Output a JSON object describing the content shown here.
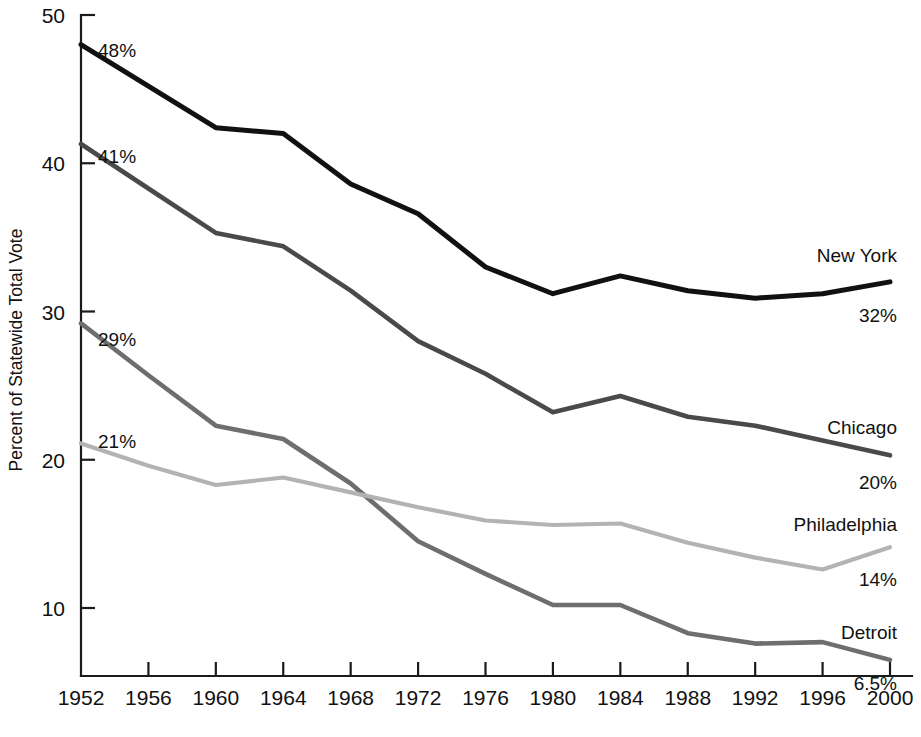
{
  "chart_data": {
    "type": "line",
    "title": "",
    "xlabel": "",
    "ylabel": "Percent of Statewide Total Vote",
    "x": [
      1952,
      1956,
      1960,
      1964,
      1968,
      1972,
      1976,
      1980,
      1984,
      1988,
      1992,
      1996,
      2000
    ],
    "xlim": [
      1952,
      2000
    ],
    "ylim": [
      4,
      50
    ],
    "y_ticks": [
      10,
      20,
      30,
      40,
      50
    ],
    "y_tick_labels": [
      "10",
      "20",
      "30",
      "40",
      "50"
    ],
    "x_tick_labels": [
      "1952",
      "1956",
      "1960",
      "1964",
      "1968",
      "1972",
      "1976",
      "1980",
      "1984",
      "1988",
      "1992",
      "1996",
      "2000"
    ],
    "grid": false,
    "legend_position": "right-inline-labels",
    "series": [
      {
        "name": "New York",
        "color": "#111111",
        "width": 5.0,
        "values": [
          48.0,
          45.2,
          42.4,
          42.0,
          38.6,
          36.6,
          33.0,
          31.2,
          32.4,
          31.4,
          30.9,
          31.2,
          32.0
        ],
        "start_label": "48%",
        "end_label": "32%"
      },
      {
        "name": "Chicago",
        "color": "#4a4a4a",
        "width": 4.6,
        "values": [
          41.3,
          38.3,
          35.3,
          34.4,
          31.4,
          28.0,
          25.8,
          23.2,
          24.3,
          22.9,
          22.3,
          21.3,
          20.3
        ],
        "start_label": "41%",
        "end_label": "20%"
      },
      {
        "name": "Detroit",
        "color": "#6e6e6e",
        "width": 4.6,
        "values": [
          29.2,
          25.7,
          22.3,
          21.4,
          18.4,
          14.5,
          12.3,
          10.2,
          10.2,
          8.3,
          7.6,
          7.7,
          6.5
        ],
        "start_label": "29%",
        "end_label": "6.5%"
      },
      {
        "name": "Philadelphia",
        "color": "#b3b3b3",
        "width": 4.2,
        "values": [
          21.1,
          19.6,
          18.3,
          18.8,
          17.8,
          16.8,
          15.9,
          15.6,
          15.7,
          14.4,
          13.4,
          12.6,
          14.1
        ],
        "start_label": "21%",
        "end_label": "14%"
      }
    ],
    "start_annotations": [
      {
        "text": "48%",
        "series": "New York"
      },
      {
        "text": "41%",
        "series": "Chicago"
      },
      {
        "text": "29%",
        "series": "Detroit"
      },
      {
        "text": "21%",
        "series": "Philadelphia"
      }
    ],
    "end_annotations": [
      {
        "text": "32%",
        "series": "New York"
      },
      {
        "text": "20%",
        "series": "Chicago"
      },
      {
        "text": "14%",
        "series": "Philadelphia"
      },
      {
        "text": "6.5%",
        "series": "Detroit"
      }
    ]
  },
  "axis": {
    "y_label": "Percent of Statewide Total Vote",
    "y_ticks": [
      "50",
      "40",
      "30",
      "20",
      "10"
    ],
    "x_ticks": [
      "1952",
      "1956",
      "1960",
      "1964",
      "1968",
      "1972",
      "1976",
      "1980",
      "1984",
      "1988",
      "1992",
      "1996",
      "2000"
    ]
  },
  "annotations": {
    "ny_start": "48%",
    "chi_start": "41%",
    "det_start": "29%",
    "phi_start": "21%",
    "ny_name": "New York",
    "ny_end": "32%",
    "chi_name": "Chicago",
    "chi_end": "20%",
    "phi_name": "Philadelphia",
    "phi_end": "14%",
    "det_name": "Detroit",
    "det_end": "6.5%"
  }
}
